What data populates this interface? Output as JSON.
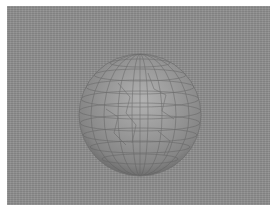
{
  "image": {
    "subject": "mesh-sphere",
    "description": "Rendered 3D sphere with quad wireframe mesh on a gray noisy background",
    "colors": {
      "background": "#8e8e8e",
      "border": "#ffffff",
      "sphere_highlight": "#b4b4b4",
      "sphere_mid": "#959595",
      "sphere_shadow": "#6e6e6e",
      "mesh_lines": "#5a5a5a"
    }
  }
}
